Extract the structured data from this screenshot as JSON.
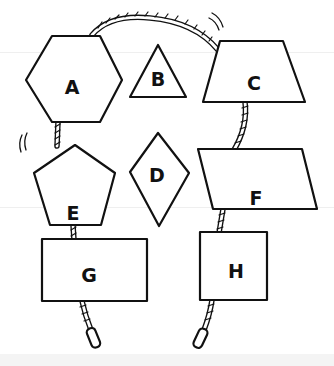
{
  "diagram": {
    "shapes": [
      {
        "id": "A",
        "label": "A",
        "type": "hexagon"
      },
      {
        "id": "B",
        "label": "B",
        "type": "triangle"
      },
      {
        "id": "C",
        "label": "C",
        "type": "trapezoid"
      },
      {
        "id": "D",
        "label": "D",
        "type": "diamond"
      },
      {
        "id": "E",
        "label": "E",
        "type": "pentagon"
      },
      {
        "id": "F",
        "label": "F",
        "type": "parallelogram"
      },
      {
        "id": "G",
        "label": "G",
        "type": "rectangle"
      },
      {
        "id": "H",
        "label": "H",
        "type": "square"
      }
    ],
    "connections": [
      {
        "from": "A",
        "to": "C",
        "kind": "rope"
      },
      {
        "from": "A",
        "to": "E",
        "kind": "rope"
      },
      {
        "from": "E",
        "to": "G",
        "kind": "rope"
      },
      {
        "from": "C",
        "to": "F",
        "kind": "rope"
      },
      {
        "from": "F",
        "to": "H",
        "kind": "rope"
      },
      {
        "from": "G",
        "to": "end",
        "kind": "rope"
      },
      {
        "from": "H",
        "to": "end",
        "kind": "rope"
      }
    ],
    "colors": {
      "stroke": "#111111",
      "fill": "#ffffff",
      "background": "#ffffff"
    }
  }
}
